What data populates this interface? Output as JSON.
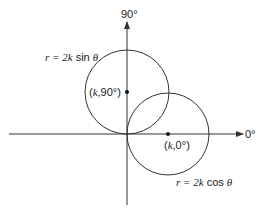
{
  "diagram": {
    "type": "polar-circles",
    "axes": {
      "vertical_label": "90°",
      "horizontal_label": "0°"
    },
    "curves": [
      {
        "name": "sine-circle",
        "equation": "r = 2k sin θ",
        "eq_prefix": "r = 2",
        "eq_k": "k",
        "eq_func": " sin ",
        "eq_theta": "θ",
        "center_point": "(k,90°)",
        "cp_open": "(",
        "cp_k": "k",
        "cp_rest": ",90°)"
      },
      {
        "name": "cosine-circle",
        "equation": "r = 2k cos θ",
        "eq_prefix": "r = 2",
        "eq_k": "k",
        "eq_func": " cos ",
        "eq_theta": "θ",
        "center_point": "(k,0°)",
        "cp_open": "(",
        "cp_k": "k",
        "cp_rest": ",0°)"
      }
    ],
    "colors": {
      "stroke": "#333333",
      "text": "#222222"
    }
  }
}
